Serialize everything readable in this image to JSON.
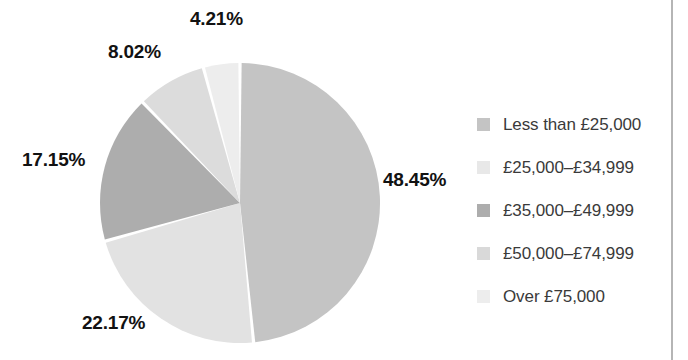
{
  "chart_data": {
    "type": "pie",
    "title": "",
    "subtitle": "",
    "xlabel": "",
    "ylabel": "",
    "legend_position": "right",
    "grid": false,
    "start_angle_deg": 0,
    "direction": "clockwise",
    "categories": [
      "Less than £25,000",
      "£25,000–£34,999",
      "£35,000–£49,999",
      "£50,000–£74,999",
      "Over £75,000"
    ],
    "values": [
      48.45,
      22.17,
      17.15,
      8.02,
      4.21
    ],
    "value_labels": [
      "48.45%",
      "22.17%",
      "17.15%",
      "8.02%",
      "4.21%"
    ],
    "colors": [
      "#c4c4c4",
      "#e2e2e2",
      "#adadad",
      "#dcdcdc",
      "#ededed"
    ],
    "units": "percent"
  },
  "pie": {
    "center_x": 240,
    "center_y": 203,
    "radius": 140,
    "gap_color": "#ffffff",
    "slices": [
      {
        "name": "less-than-25000",
        "label": "48.45%",
        "value": 48.45,
        "color": "#c4c4c4",
        "label_x": 383,
        "label_y": 169
      },
      {
        "name": "25000-34999",
        "label": "22.17%",
        "value": 22.17,
        "color": "#e2e2e2",
        "label_x": 82,
        "label_y": 312
      },
      {
        "name": "35000-49999",
        "label": "17.15%",
        "value": 17.15,
        "color": "#adadad",
        "label_x": 22,
        "label_y": 149
      },
      {
        "name": "50000-74999",
        "label": "8.02%",
        "value": 8.02,
        "color": "#dcdcdc",
        "label_x": 108,
        "label_y": 41
      },
      {
        "name": "over-75000",
        "label": "4.21%",
        "value": 4.21,
        "color": "#ededed",
        "label_x": 190,
        "label_y": 8
      }
    ]
  },
  "legend": {
    "items": [
      {
        "label": "Less than £25,000",
        "color": "#c4c4c4",
        "key": "less-than-25000"
      },
      {
        "label": "£25,000–£34,999",
        "color": "#e8e8e8",
        "key": "25000-34999"
      },
      {
        "label": "£35,000–£49,999",
        "color": "#adadad",
        "key": "35000-49999"
      },
      {
        "label": "£50,000–£74,999",
        "color": "#d9d9d9",
        "key": "50000-74999"
      },
      {
        "label": "Over £75,000",
        "color": "#ededed",
        "key": "over-75000"
      }
    ]
  },
  "colors": {
    "background": "#ffffff",
    "label_text": "#121212",
    "legend_text": "#3a3a3a",
    "rule": "#b5b5b5"
  }
}
